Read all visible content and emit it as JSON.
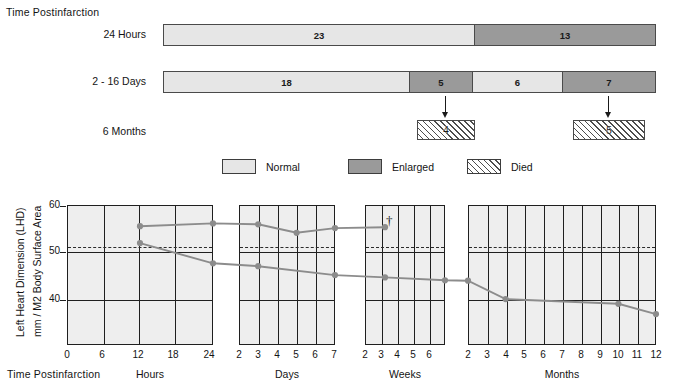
{
  "figure": {
    "top_title": "Time Postinfarction",
    "rows": [
      {
        "label": "24 Hours",
        "segments": [
          {
            "value": "23",
            "category": "Normal"
          },
          {
            "value": "13",
            "category": "Enlarged"
          }
        ]
      },
      {
        "label": "2 - 16 Days",
        "segments": [
          {
            "value": "18",
            "category": "Normal"
          },
          {
            "value": "5",
            "category": "Enlarged"
          },
          {
            "value": "6",
            "category": "Normal"
          },
          {
            "value": "7",
            "category": "Enlarged"
          }
        ]
      },
      {
        "label": "6 Months",
        "segments": [
          {
            "value": "4",
            "category": "Died"
          },
          {
            "value": "5",
            "category": "Died"
          }
        ]
      }
    ],
    "legend": [
      {
        "label": "Normal",
        "swatch": "normal"
      },
      {
        "label": "Enlarged",
        "swatch": "enlarged"
      },
      {
        "label": "Died",
        "swatch": "died"
      }
    ]
  },
  "chart_axis": {
    "ylabel_line1": "Left Heart Dimension (LHD)",
    "ylabel_line2": "mm / M2 Body Surface Area",
    "xlabel": "Time Postinfarction",
    "yticks": [
      "60",
      "50",
      "40"
    ],
    "panels": [
      {
        "unit": "Hours",
        "ticks": [
          "0",
          "6",
          "12",
          "18",
          "24"
        ]
      },
      {
        "unit": "Days",
        "ticks": [
          "2",
          "3",
          "4",
          "5",
          "6",
          "7"
        ]
      },
      {
        "unit": "Weeks",
        "ticks": [
          "2",
          "3",
          "4",
          "5",
          "6"
        ]
      },
      {
        "unit": "Months",
        "ticks": [
          "2",
          "3",
          "4",
          "5",
          "6",
          "7",
          "8",
          "9",
          "10",
          "11",
          "12"
        ]
      }
    ],
    "annotation_dagger": "†"
  },
  "chart_data": {
    "type": "line",
    "xlabel": "Time Postinfarction",
    "ylabel": "Left Heart Dimension (LHD) mm / M2 Body Surface Area",
    "ylim": [
      32,
      60
    ],
    "yticks": [
      40,
      50,
      60
    ],
    "grid": true,
    "legend_position": "none",
    "reference_line": {
      "label": "upper limit of normal",
      "value": 51,
      "style": "dashed"
    },
    "panels": [
      {
        "unit": "Hours",
        "xticks": [
          0,
          6,
          12,
          18,
          24
        ]
      },
      {
        "unit": "Days",
        "xticks": [
          2,
          3,
          4,
          5,
          6,
          7
        ]
      },
      {
        "unit": "Weeks",
        "xticks": [
          2,
          3,
          4,
          5,
          6
        ]
      },
      {
        "unit": "Months",
        "xticks": [
          2,
          3,
          4,
          5,
          6,
          7,
          8,
          9,
          10,
          11,
          12
        ]
      }
    ],
    "series": [
      {
        "name": "Enlarged / Died group",
        "color": "#8c8c8c",
        "points": [
          {
            "panel": "Hours",
            "x": 12,
            "y": 55.7
          },
          {
            "panel": "Hours",
            "x": 24,
            "y": 56.3
          },
          {
            "panel": "Days",
            "x": 3,
            "y": 56.1
          },
          {
            "panel": "Days",
            "x": 5,
            "y": 54.3
          },
          {
            "panel": "Days",
            "x": 7,
            "y": 55.3
          },
          {
            "panel": "Weeks",
            "x": 3,
            "y": 55.5
          }
        ],
        "end_marker": "†"
      },
      {
        "name": "Normal group",
        "color": "#8c8c8c",
        "points": [
          {
            "panel": "Hours",
            "x": 12,
            "y": 52.1
          },
          {
            "panel": "Hours",
            "x": 24,
            "y": 47.8
          },
          {
            "panel": "Days",
            "x": 3,
            "y": 47.2
          },
          {
            "panel": "Days",
            "x": 7,
            "y": 45.3
          },
          {
            "panel": "Weeks",
            "x": 3,
            "y": 44.8
          },
          {
            "panel": "Weeks",
            "x": 6,
            "y": 44.2
          },
          {
            "panel": "Months",
            "x": 2,
            "y": 44.1
          },
          {
            "panel": "Months",
            "x": 4,
            "y": 40.2
          },
          {
            "panel": "Months",
            "x": 10,
            "y": 39.2
          },
          {
            "panel": "Months",
            "x": 12,
            "y": 37.0
          }
        ]
      }
    ]
  }
}
